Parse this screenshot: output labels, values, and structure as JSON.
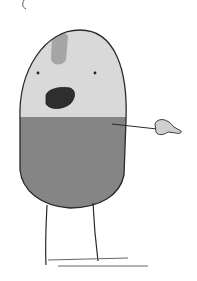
{
  "illustration": {
    "subject": "pill-shaped cartoon character pointing right",
    "colors": {
      "background": "#ffffff",
      "head": "#d9d9d9",
      "body": "#858585",
      "stripe": "#a6a6a6",
      "mouth": "#2e2e2e",
      "outline": "#2a2a2a",
      "hand": "#cfcfcf"
    }
  }
}
